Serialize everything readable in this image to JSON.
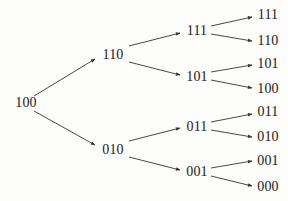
{
  "diagram": {
    "type": "binary-tree",
    "direction": "left-to-right",
    "edge_color": "#333333",
    "text_color": "#1a1a1a",
    "nodes": [
      {
        "id": "n0",
        "label": "100",
        "x": 26,
        "y": 103
      },
      {
        "id": "n1",
        "label": "110",
        "x": 113,
        "y": 55
      },
      {
        "id": "n2",
        "label": "010",
        "x": 113,
        "y": 150
      },
      {
        "id": "n3",
        "label": "111",
        "x": 197,
        "y": 31
      },
      {
        "id": "n4",
        "label": "101",
        "x": 197,
        "y": 77
      },
      {
        "id": "n5",
        "label": "011",
        "x": 197,
        "y": 127
      },
      {
        "id": "n6",
        "label": "001",
        "x": 197,
        "y": 172
      },
      {
        "id": "n7",
        "label": "111",
        "x": 268,
        "y": 15
      },
      {
        "id": "n8",
        "label": "110",
        "x": 268,
        "y": 41
      },
      {
        "id": "n9",
        "label": "101",
        "x": 268,
        "y": 64
      },
      {
        "id": "n10",
        "label": "100",
        "x": 268,
        "y": 89
      },
      {
        "id": "n11",
        "label": "011",
        "x": 268,
        "y": 112
      },
      {
        "id": "n12",
        "label": "010",
        "x": 268,
        "y": 137
      },
      {
        "id": "n13",
        "label": "001",
        "x": 268,
        "y": 161
      },
      {
        "id": "n14",
        "label": "000",
        "x": 268,
        "y": 187
      }
    ],
    "edges": [
      {
        "from": "n0",
        "to": "n1",
        "x1": 34,
        "y1": 96,
        "x2": 95,
        "y2": 59
      },
      {
        "from": "n0",
        "to": "n2",
        "x1": 34,
        "y1": 111,
        "x2": 95,
        "y2": 145
      },
      {
        "from": "n1",
        "to": "n3",
        "x1": 129,
        "y1": 46,
        "x2": 180,
        "y2": 33
      },
      {
        "from": "n1",
        "to": "n4",
        "x1": 129,
        "y1": 62,
        "x2": 180,
        "y2": 75
      },
      {
        "from": "n2",
        "to": "n5",
        "x1": 129,
        "y1": 141,
        "x2": 180,
        "y2": 128
      },
      {
        "from": "n2",
        "to": "n6",
        "x1": 129,
        "y1": 157,
        "x2": 180,
        "y2": 170
      },
      {
        "from": "n3",
        "to": "n7",
        "x1": 211,
        "y1": 26,
        "x2": 252,
        "y2": 17
      },
      {
        "from": "n3",
        "to": "n8",
        "x1": 211,
        "y1": 34,
        "x2": 252,
        "y2": 41
      },
      {
        "from": "n4",
        "to": "n9",
        "x1": 211,
        "y1": 72,
        "x2": 252,
        "y2": 65
      },
      {
        "from": "n4",
        "to": "n10",
        "x1": 211,
        "y1": 80,
        "x2": 252,
        "y2": 88
      },
      {
        "from": "n5",
        "to": "n11",
        "x1": 211,
        "y1": 122,
        "x2": 252,
        "y2": 114
      },
      {
        "from": "n5",
        "to": "n12",
        "x1": 211,
        "y1": 130,
        "x2": 252,
        "y2": 137
      },
      {
        "from": "n6",
        "to": "n13",
        "x1": 211,
        "y1": 168,
        "x2": 252,
        "y2": 161
      },
      {
        "from": "n6",
        "to": "n14",
        "x1": 211,
        "y1": 176,
        "x2": 252,
        "y2": 186
      }
    ]
  }
}
